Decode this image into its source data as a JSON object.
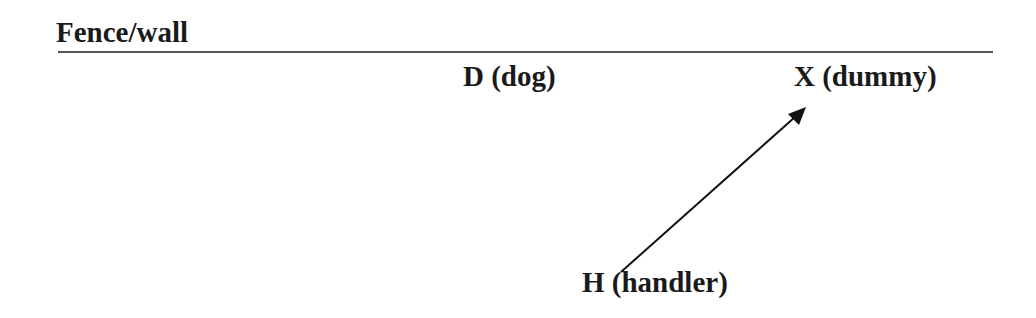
{
  "diagram": {
    "fence_label": "Fence/wall",
    "dog_label": "D (dog)",
    "dummy_label": "X (dummy)",
    "handler_label": "H (handler)",
    "line_color": "#555555",
    "arrow_color": "#111111"
  }
}
